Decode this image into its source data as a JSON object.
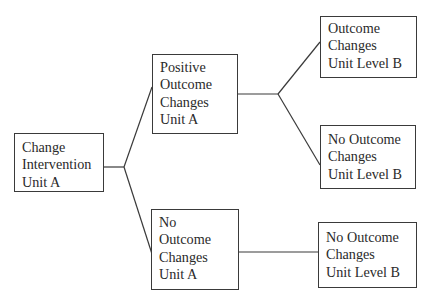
{
  "diagram": {
    "type": "tree",
    "nodes": {
      "root": {
        "lines": [
          "Change",
          "Intervention",
          "Unit A"
        ]
      },
      "positive_a": {
        "lines": [
          "Positive",
          "Outcome",
          "Changes",
          "Unit A"
        ]
      },
      "no_a": {
        "lines": [
          "No",
          "Outcome",
          "Changes",
          "Unit A"
        ]
      },
      "positive_b1": {
        "lines": [
          "Outcome",
          "Changes",
          "Unit Level B"
        ]
      },
      "positive_b2": {
        "lines": [
          "No Outcome",
          "Changes",
          "Unit Level B"
        ]
      },
      "no_b": {
        "lines": [
          "No Outcome",
          "Changes",
          "Unit Level B"
        ]
      }
    },
    "edges": [
      {
        "from": "root",
        "to": "positive_a"
      },
      {
        "from": "root",
        "to": "no_a"
      },
      {
        "from": "positive_a",
        "to": "positive_b1"
      },
      {
        "from": "positive_a",
        "to": "positive_b2"
      },
      {
        "from": "no_a",
        "to": "no_b"
      }
    ],
    "colors": {
      "line": "#3a3a3a",
      "text": "#2a2a2a",
      "background": "#ffffff"
    }
  }
}
